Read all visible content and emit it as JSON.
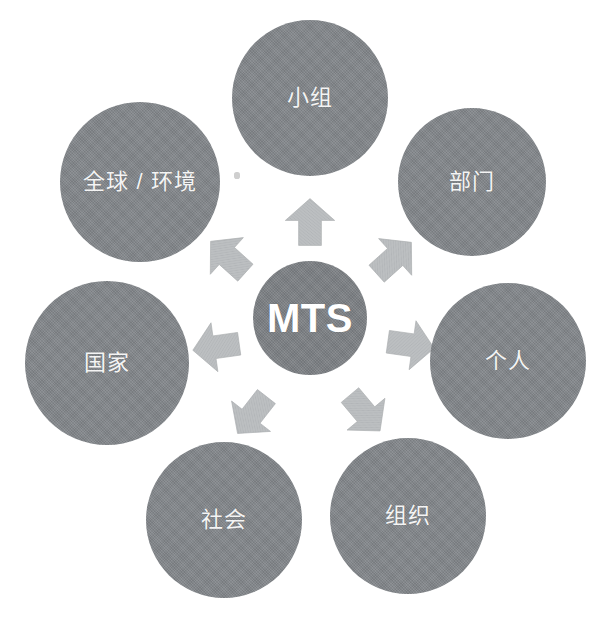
{
  "diagram": {
    "type": "radial-hub-and-spoke",
    "background_color": "#ffffff",
    "node_fill_color": "#82868a",
    "node_text_color": "#f4f4f4",
    "arrow_fill_color": "#b9bcbe",
    "hub": {
      "label": "MTS",
      "cx": 310,
      "cy": 318,
      "r": 57
    },
    "nodes": [
      {
        "id": "team",
        "label": "小组",
        "cx": 310,
        "cy": 98,
        "r": 78,
        "angle_deg": 90
      },
      {
        "id": "department",
        "label": "部门",
        "cx": 472,
        "cy": 182,
        "r": 74,
        "angle_deg": 38
      },
      {
        "id": "individual",
        "label": "个人",
        "cx": 508,
        "cy": 361,
        "r": 78,
        "angle_deg": -14
      },
      {
        "id": "organization",
        "label": "组织",
        "cx": 408,
        "cy": 516,
        "r": 78,
        "angle_deg": -60
      },
      {
        "id": "society",
        "label": "社会",
        "cx": 224,
        "cy": 520,
        "r": 78,
        "angle_deg": -120
      },
      {
        "id": "country",
        "label": "国家",
        "cx": 107,
        "cy": 363,
        "r": 82,
        "angle_deg": 170
      },
      {
        "id": "global",
        "label": "全球 / 环境",
        "cx": 140,
        "cy": 182,
        "r": 80,
        "angle_deg": 130
      }
    ],
    "arrows": [
      {
        "id": "arrow-to-team",
        "target": "team",
        "direction": "up",
        "angle_deg": 0,
        "cx": 310,
        "cy": 222
      },
      {
        "id": "arrow-to-department",
        "target": "department",
        "direction": "up-right",
        "angle_deg": 48,
        "cx": 394,
        "cy": 258
      },
      {
        "id": "arrow-to-individual",
        "target": "individual",
        "direction": "right",
        "angle_deg": 98,
        "cx": 411,
        "cy": 345
      },
      {
        "id": "arrow-to-organization",
        "target": "organization",
        "direction": "down-right",
        "angle_deg": 140,
        "cx": 365,
        "cy": 413
      },
      {
        "id": "arrow-to-society",
        "target": "society",
        "direction": "down-left",
        "angle_deg": 218,
        "cx": 252,
        "cy": 415
      },
      {
        "id": "arrow-to-country",
        "target": "country",
        "direction": "left",
        "angle_deg": 262,
        "cx": 216,
        "cy": 347
      },
      {
        "id": "arrow-to-global",
        "target": "global",
        "direction": "up-left",
        "angle_deg": 312,
        "cx": 228,
        "cy": 257
      }
    ]
  }
}
